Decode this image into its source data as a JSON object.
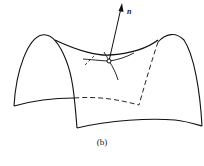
{
  "figure": {
    "caption": "(b)",
    "normal_vector_label": "n"
  }
}
